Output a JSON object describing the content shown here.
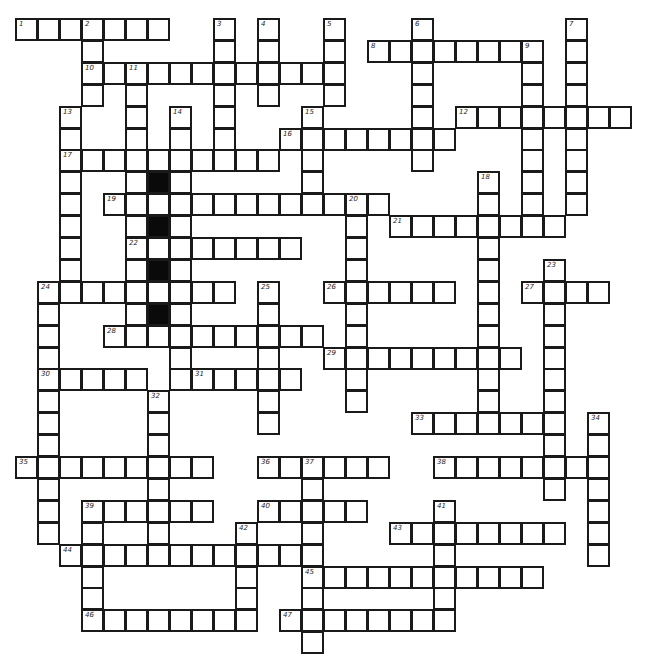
{
  "puzzle": {
    "type": "crossword",
    "cell_size": 22,
    "origin_x": 16,
    "origin_y": 19,
    "row_height": 21.9,
    "colors": {
      "line": "#1a1a1a",
      "black_cell": "#0a0a0a",
      "background": "#ffffff"
    },
    "black_cells": [
      [
        7,
        6
      ],
      [
        9,
        6
      ],
      [
        11,
        6
      ],
      [
        13,
        6
      ]
    ],
    "across": [
      {
        "num": "1",
        "r": 0,
        "c": 0,
        "len": 7
      },
      {
        "num": "8",
        "r": 1,
        "c": 16,
        "len": 8
      },
      {
        "num": "10",
        "r": 2,
        "c": 3,
        "len": 12
      },
      {
        "num": "12",
        "r": 4,
        "c": 20,
        "len": 8
      },
      {
        "num": "16",
        "r": 5,
        "c": 12,
        "len": 8
      },
      {
        "num": "17",
        "r": 6,
        "c": 2,
        "len": 10
      },
      {
        "num": "19",
        "r": 8,
        "c": 4,
        "len": 13
      },
      {
        "num": "21",
        "r": 9,
        "c": 17,
        "len": 8
      },
      {
        "num": "22",
        "r": 10,
        "c": 5,
        "len": 8
      },
      {
        "num": "24",
        "r": 12,
        "c": 1,
        "len": 9
      },
      {
        "num": "26",
        "r": 12,
        "c": 14,
        "len": 6
      },
      {
        "num": "27",
        "r": 12,
        "c": 23,
        "len": 4
      },
      {
        "num": "28",
        "r": 14,
        "c": 4,
        "len": 10
      },
      {
        "num": "29",
        "r": 15,
        "c": 14,
        "len": 9
      },
      {
        "num": "30",
        "r": 16,
        "c": 1,
        "len": 5
      },
      {
        "num": "31",
        "r": 16,
        "c": 8,
        "len": 5
      },
      {
        "num": "33",
        "r": 18,
        "c": 18,
        "len": 7
      },
      {
        "num": "35",
        "r": 20,
        "c": 0,
        "len": 9
      },
      {
        "num": "36",
        "r": 20,
        "c": 11,
        "len": 6
      },
      {
        "num": "38",
        "r": 20,
        "c": 19,
        "len": 8
      },
      {
        "num": "39",
        "r": 22,
        "c": 3,
        "len": 6
      },
      {
        "num": "40",
        "r": 22,
        "c": 11,
        "len": 5
      },
      {
        "num": "43",
        "r": 23,
        "c": 17,
        "len": 8
      },
      {
        "num": "44",
        "r": 24,
        "c": 2,
        "len": 12
      },
      {
        "num": "45",
        "r": 25,
        "c": 13,
        "len": 11
      },
      {
        "num": "46",
        "r": 27,
        "c": 3,
        "len": 7
      },
      {
        "num": "47",
        "r": 27,
        "c": 12,
        "len": 8
      }
    ],
    "down": [
      {
        "num": "2",
        "r": 0,
        "c": 3,
        "len": 4
      },
      {
        "num": "3",
        "r": 0,
        "c": 9,
        "len": 7
      },
      {
        "num": "4",
        "r": 0,
        "c": 11,
        "len": 4
      },
      {
        "num": "5",
        "r": 0,
        "c": 14,
        "len": 4
      },
      {
        "num": "6",
        "r": 0,
        "c": 18,
        "len": 7
      },
      {
        "num": "7",
        "r": 0,
        "c": 25,
        "len": 9
      },
      {
        "num": "9",
        "r": 1,
        "c": 23,
        "len": 8
      },
      {
        "num": "11",
        "r": 2,
        "c": 5,
        "len": 13
      },
      {
        "num": "13",
        "r": 4,
        "c": 2,
        "len": 8
      },
      {
        "num": "14",
        "r": 4,
        "c": 7,
        "len": 13
      },
      {
        "num": "15",
        "r": 4,
        "c": 13,
        "len": 5
      },
      {
        "num": "18",
        "r": 7,
        "c": 21,
        "len": 12
      },
      {
        "num": "20",
        "r": 8,
        "c": 15,
        "len": 10
      },
      {
        "num": "23",
        "r": 11,
        "c": 24,
        "len": 11
      },
      {
        "num": "24",
        "r": 12,
        "c": 1,
        "len": 12
      },
      {
        "num": "25",
        "r": 12,
        "c": 11,
        "len": 7
      },
      {
        "num": "32",
        "r": 17,
        "c": 6,
        "len": 8
      },
      {
        "num": "34",
        "r": 18,
        "c": 26,
        "len": 7
      },
      {
        "num": "37",
        "r": 20,
        "c": 13,
        "len": 9
      },
      {
        "num": "39",
        "r": 22,
        "c": 3,
        "len": 6
      },
      {
        "num": "41",
        "r": 22,
        "c": 19,
        "len": 6
      },
      {
        "num": "42",
        "r": 23,
        "c": 10,
        "len": 5
      }
    ]
  }
}
